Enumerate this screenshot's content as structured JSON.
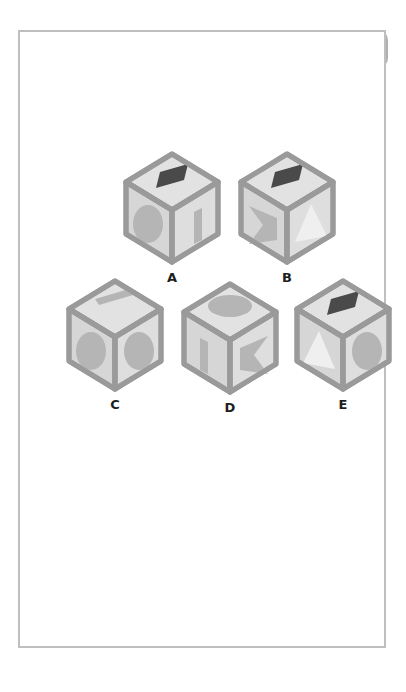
{
  "header": {
    "label": "puzzle",
    "steps": [
      {
        "name": "step-current",
        "text": "10",
        "filled": true
      },
      {
        "name": "step-next-1",
        "text": "",
        "filled": false
      },
      {
        "name": "step-next-2",
        "text": "",
        "filled": false
      }
    ]
  },
  "colors": {
    "banner": "#b0b0b0",
    "page_border": "#bfbfbf",
    "cube_edge": "#9a9a9a",
    "face_top": "#e2e2e2",
    "face_left": "#d6d6d6",
    "face_right": "#dedede",
    "mark_dark": "#4a4a4a",
    "mark_medium": "#b5b5b5",
    "mark_light": "#efefef",
    "label_text": "#1d1d1d",
    "puzzle_text": "#3a3a3a",
    "step_text": "#ffffff"
  },
  "puzzle": {
    "type": "cube-folding-visual-reasoning",
    "option_count": 5,
    "options": [
      {
        "label": "A",
        "x": 92,
        "y": 118,
        "faces": {
          "top": {
            "mark": "parallelogram",
            "shade": "dark"
          },
          "left": {
            "mark": "ellipse",
            "shade": "medium"
          },
          "right": {
            "mark": "bar",
            "shade": "medium"
          }
        }
      },
      {
        "label": "B",
        "x": 207,
        "y": 118,
        "faces": {
          "top": {
            "mark": "parallelogram",
            "shade": "dark"
          },
          "left": {
            "mark": "bowtie",
            "shade": "medium"
          },
          "right": {
            "mark": "triangle",
            "shade": "light"
          }
        }
      },
      {
        "label": "C",
        "x": 35,
        "y": 245,
        "faces": {
          "top": {
            "mark": "bar",
            "shade": "medium"
          },
          "left": {
            "mark": "ellipse",
            "shade": "medium"
          },
          "right": {
            "mark": "ellipse",
            "shade": "medium"
          }
        }
      },
      {
        "label": "D",
        "x": 150,
        "y": 248,
        "faces": {
          "top": {
            "mark": "ellipse",
            "shade": "medium"
          },
          "left": {
            "mark": "bar",
            "shade": "medium"
          },
          "right": {
            "mark": "bowtie",
            "shade": "medium"
          }
        }
      },
      {
        "label": "E",
        "x": 263,
        "y": 245,
        "faces": {
          "top": {
            "mark": "parallelogram",
            "shade": "dark"
          },
          "left": {
            "mark": "triangle",
            "shade": "light"
          },
          "right": {
            "mark": "ellipse",
            "shade": "medium"
          }
        }
      }
    ]
  }
}
